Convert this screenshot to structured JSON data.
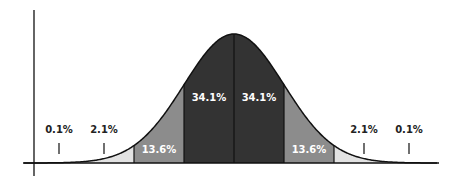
{
  "chart_data": {
    "type": "area",
    "title": "",
    "subtitle": "",
    "xlabel": "",
    "ylabel": "",
    "x_units": "standard deviations from mean",
    "bands": [
      {
        "from": -3,
        "to": -2,
        "label": "2.1%",
        "value": 2.1,
        "fill": "#e2e2e2",
        "label_outside": true
      },
      {
        "from": -2,
        "to": -1,
        "label": "13.6%",
        "value": 13.6,
        "fill": "#8c8c8c"
      },
      {
        "from": -1,
        "to": 0,
        "label": "34.1%",
        "value": 34.1,
        "fill": "#333333"
      },
      {
        "from": 0,
        "to": 1,
        "label": "34.1%",
        "value": 34.1,
        "fill": "#333333"
      },
      {
        "from": 1,
        "to": 2,
        "label": "13.6%",
        "value": 13.6,
        "fill": "#8c8c8c"
      },
      {
        "from": 2,
        "to": 3,
        "label": "2.1%",
        "value": 2.1,
        "fill": "#e2e2e2",
        "label_outside": true
      }
    ],
    "tails": [
      {
        "side": "left",
        "beyond": -3,
        "label": "0.1%",
        "value": 0.1
      },
      {
        "side": "right",
        "beyond": 3,
        "label": "0.1%",
        "value": 0.1
      }
    ],
    "outer_labels": [
      {
        "text": "0.1%",
        "sigma": -3.5
      },
      {
        "text": "2.1%",
        "sigma": -2.6
      },
      {
        "text": "2.1%",
        "sigma": 2.6
      },
      {
        "text": "0.1%",
        "sigma": 3.5
      }
    ],
    "grid": false,
    "legend": "none",
    "xlim": [
      -4.2,
      4.1
    ],
    "colors": {
      "curve": "#111111",
      "axis": "#111111",
      "inner_label": "#ffffff",
      "outer_label": "#222222"
    }
  }
}
